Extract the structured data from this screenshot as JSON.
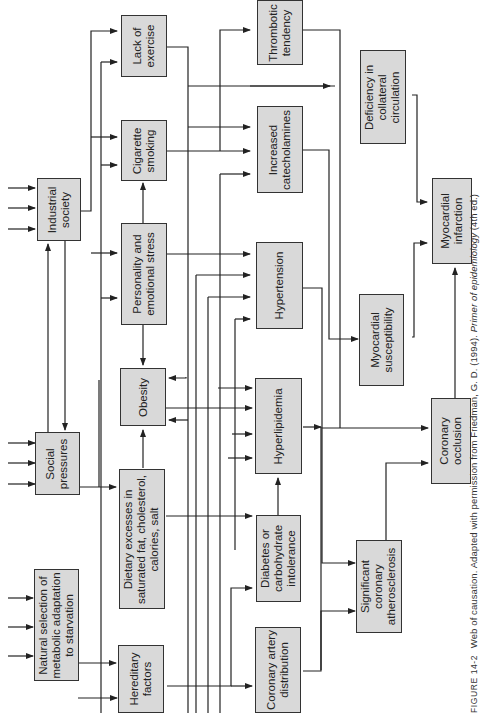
{
  "figure": {
    "label": "FIGURE 14-2",
    "title": "Web of causation.",
    "credit_prefix": "Adapted with permission from Friedman, G. D. (1994).",
    "credit_book": "Primer of epidemiology",
    "credit_suffix": "(4th ed.)"
  },
  "nodes": {
    "industrial_society": "Industrial\nsociety",
    "social_pressures": "Social\npressures",
    "natural_selection": "Natural selection of\nmetabolic adaptation\nto starvation",
    "lack_of_exercise": "Lack of\nexercise",
    "cigarette_smoking": "Cigarette\nsmoking",
    "personality_stress": "Personality and\nemotional stress",
    "obesity": "Obesity",
    "dietary_excesses": "Dietary excesses in\nsaturated fat, cholesterol,\ncalories, salt",
    "hereditary_factors": "Hereditary\nfactors",
    "thrombotic_tendency": "Thrombotic\ntendency",
    "increased_catecholamines": "Increased\ncatecholamines",
    "hypertension": "Hypertension",
    "hyperlipidemia": "Hyperlipidemia",
    "diabetes": "Diabetes or\ncarbohydrate\nintolerance",
    "coronary_artery_distribution": "Coronary artery\ndistribution",
    "deficiency_collateral": "Deficiency in\ncollateral\ncirculation",
    "myocardial_susceptibility": "Myocardial\nsusceptibility",
    "significant_atherosclerosis": "Significant\ncoronary\natherosclerosis",
    "coronary_occlusion": "Coronary\nocclusion",
    "myocardial_infarction": "Myocardial\ninfarction"
  },
  "colors": {
    "box_fill": "#d9d9d9",
    "line": "#222222"
  }
}
